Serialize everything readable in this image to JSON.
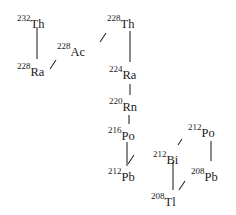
{
  "diagram": {
    "nuclides": [
      {
        "id": "th232",
        "mass": "232",
        "symbol": "Th",
        "x": 17,
        "y": 15
      },
      {
        "id": "ra228",
        "mass": "228",
        "symbol": "Ra",
        "x": 17,
        "y": 63
      },
      {
        "id": "ac228",
        "mass": "228",
        "symbol": "Ac",
        "x": 57,
        "y": 43
      },
      {
        "id": "th228",
        "mass": "228",
        "symbol": "Th",
        "x": 107,
        "y": 15
      },
      {
        "id": "ra224",
        "mass": "224",
        "symbol": "Ra",
        "x": 109,
        "y": 66
      },
      {
        "id": "rn220",
        "mass": "220",
        "symbol": "Rn",
        "x": 109,
        "y": 98
      },
      {
        "id": "po216",
        "mass": "216",
        "symbol": "Po",
        "x": 108,
        "y": 127
      },
      {
        "id": "pb212",
        "mass": "212",
        "symbol": "Pb",
        "x": 108,
        "y": 168
      },
      {
        "id": "bi212",
        "mass": "212",
        "symbol": "Bi",
        "x": 153,
        "y": 151
      },
      {
        "id": "po212",
        "mass": "212",
        "symbol": "Po",
        "x": 188,
        "y": 124
      },
      {
        "id": "pb208",
        "mass": "208",
        "symbol": "Pb",
        "x": 191,
        "y": 168
      },
      {
        "id": "tl208",
        "mass": "208",
        "symbol": "Tl",
        "x": 151,
        "y": 193
      }
    ],
    "transitions": [
      {
        "from": "th232",
        "to": "ra228",
        "type": "alpha"
      },
      {
        "from": "ra228",
        "to": "ac228",
        "type": "beta"
      },
      {
        "from": "ac228",
        "to": "th228",
        "type": "beta"
      },
      {
        "from": "th228",
        "to": "ra224",
        "type": "alpha"
      },
      {
        "from": "ra224",
        "to": "rn220",
        "type": "alpha"
      },
      {
        "from": "rn220",
        "to": "po216",
        "type": "alpha"
      },
      {
        "from": "po216",
        "to": "pb212",
        "type": "alpha"
      },
      {
        "from": "pb212",
        "to": "bi212",
        "type": "beta"
      },
      {
        "from": "bi212",
        "to": "po212",
        "type": "beta"
      },
      {
        "from": "bi212",
        "to": "tl208",
        "type": "alpha"
      },
      {
        "from": "po212",
        "to": "pb208",
        "type": "alpha"
      },
      {
        "from": "tl208",
        "to": "pb208",
        "type": "beta"
      }
    ]
  }
}
